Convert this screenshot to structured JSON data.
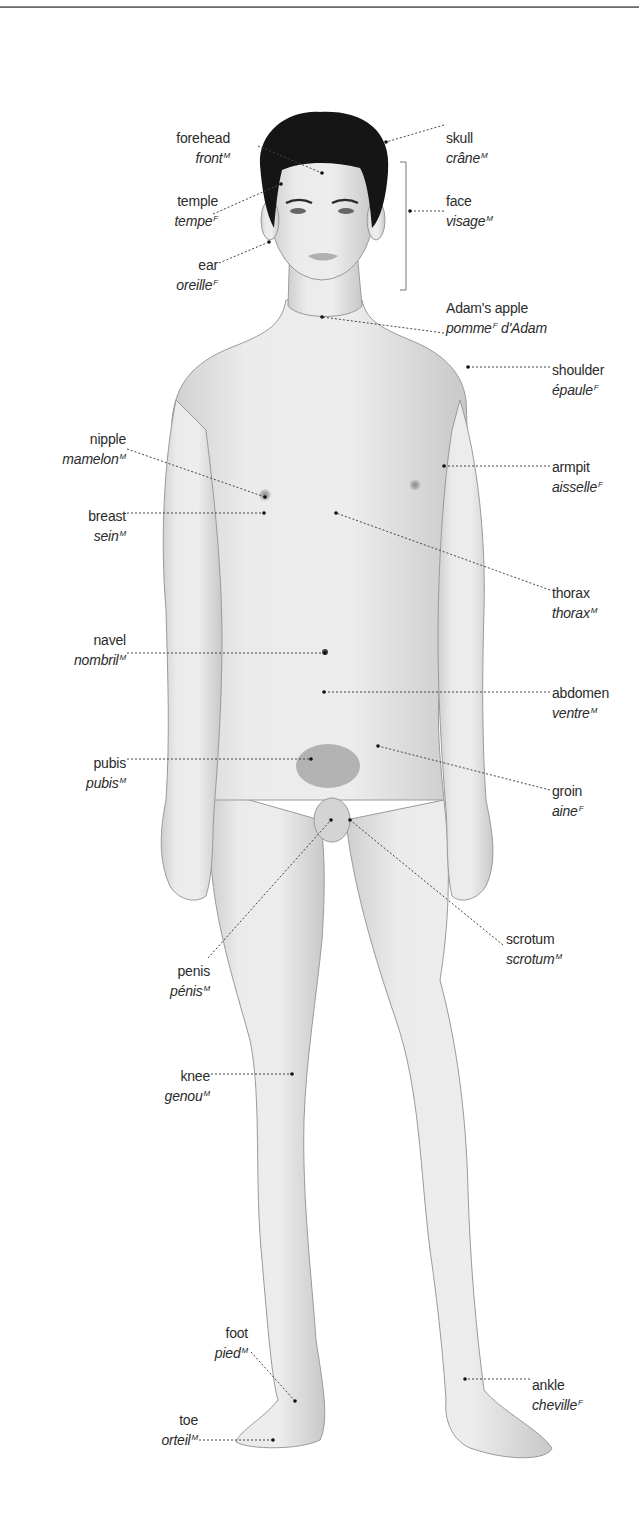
{
  "figure": {
    "colors": {
      "skin": "#e6e6e6",
      "skin_shadow": "#c9c9c9",
      "outline": "#8a8a8a",
      "hair": "#141414",
      "leader": "#444444",
      "text": "#2b2b2b",
      "rule": "#6e6e6e"
    }
  },
  "labels": [
    {
      "id": "forehead",
      "en": "forehead",
      "fr": "front",
      "gender": "M",
      "side": "left",
      "x": 230,
      "y": 130,
      "point": [
        322,
        173
      ],
      "from": [
        258,
        146
      ]
    },
    {
      "id": "skull",
      "en": "skull",
      "fr": "crâne",
      "gender": "M",
      "side": "right",
      "x": 446,
      "y": 130,
      "point": [
        386,
        142
      ],
      "from": [
        444,
        125
      ]
    },
    {
      "id": "temple",
      "en": "temple",
      "fr": "tempe",
      "gender": "F",
      "side": "left",
      "x": 218,
      "y": 193,
      "point": [
        281,
        184
      ],
      "from": [
        213,
        214
      ]
    },
    {
      "id": "face",
      "en": "face",
      "fr": "visage",
      "gender": "M",
      "side": "right",
      "x": 446,
      "y": 193,
      "point": [
        410,
        211
      ],
      "from": [
        444,
        211
      ]
    },
    {
      "id": "ear",
      "en": "ear",
      "fr": "oreille",
      "gender": "F",
      "side": "left",
      "x": 218,
      "y": 257,
      "point": [
        269,
        242
      ],
      "from": [
        219,
        263
      ]
    },
    {
      "id": "adams-apple",
      "en": "Adam's apple",
      "fr": "pomme",
      "gender": "F",
      "fr_suffix": " d'Adam",
      "side": "right",
      "x": 446,
      "y": 300,
      "point": [
        322,
        317
      ],
      "from": [
        444,
        333
      ]
    },
    {
      "id": "shoulder",
      "en": "shoulder",
      "fr": "épaule",
      "gender": "F",
      "side": "right",
      "x": 552,
      "y": 362,
      "point": [
        468,
        367
      ],
      "from": [
        550,
        367
      ]
    },
    {
      "id": "nipple",
      "en": "nipple",
      "fr": "mamelon",
      "gender": "M",
      "side": "left",
      "x": 126,
      "y": 431,
      "point": [
        265,
        497
      ],
      "from": [
        127,
        449
      ]
    },
    {
      "id": "breast",
      "en": "breast",
      "fr": "sein",
      "gender": "M",
      "side": "left",
      "x": 126,
      "y": 508,
      "point": [
        264,
        513
      ],
      "from": [
        127,
        513
      ]
    },
    {
      "id": "armpit",
      "en": "armpit",
      "fr": "aisselle",
      "gender": "F",
      "side": "right",
      "x": 552,
      "y": 459,
      "point": [
        444,
        466
      ],
      "from": [
        550,
        466
      ]
    },
    {
      "id": "thorax",
      "en": "thorax",
      "fr": "thorax",
      "gender": "M",
      "side": "right",
      "x": 552,
      "y": 585,
      "point": [
        336,
        513
      ],
      "from": [
        550,
        590
      ]
    },
    {
      "id": "navel",
      "en": "navel",
      "fr": "nombril",
      "gender": "M",
      "side": "left",
      "x": 126,
      "y": 632,
      "point": [
        325,
        653
      ],
      "from": [
        127,
        653
      ]
    },
    {
      "id": "abdomen",
      "en": "abdomen",
      "fr": "ventre",
      "gender": "M",
      "side": "right",
      "x": 552,
      "y": 685,
      "point": [
        324,
        692
      ],
      "from": [
        550,
        692
      ]
    },
    {
      "id": "pubis",
      "en": "pubis",
      "fr": "pubis",
      "gender": "M",
      "side": "left",
      "x": 126,
      "y": 755,
      "point": [
        311,
        759
      ],
      "from": [
        127,
        759
      ]
    },
    {
      "id": "groin",
      "en": "groin",
      "fr": "aine",
      "gender": "F",
      "side": "right",
      "x": 552,
      "y": 783,
      "point": [
        378,
        746
      ],
      "from": [
        550,
        790
      ]
    },
    {
      "id": "scrotum",
      "en": "scrotum",
      "fr": "scrotum",
      "gender": "M",
      "side": "right",
      "x": 506,
      "y": 931,
      "point": [
        350,
        820
      ],
      "from": [
        503,
        945
      ]
    },
    {
      "id": "penis",
      "en": "penis",
      "fr": "pénis",
      "gender": "M",
      "side": "left",
      "x": 210,
      "y": 963,
      "point": [
        331,
        820
      ],
      "from": [
        208,
        958
      ]
    },
    {
      "id": "knee",
      "en": "knee",
      "fr": "genou",
      "gender": "M",
      "side": "left",
      "x": 210,
      "y": 1068,
      "point": [
        292,
        1074
      ],
      "from": [
        211,
        1074
      ]
    },
    {
      "id": "foot",
      "en": "foot",
      "fr": "pied",
      "gender": "M",
      "side": "left",
      "x": 248,
      "y": 1325,
      "point": [
        295,
        1401
      ],
      "from": [
        251,
        1352
      ]
    },
    {
      "id": "ankle",
      "en": "ankle",
      "fr": "cheville",
      "gender": "F",
      "side": "right",
      "x": 532,
      "y": 1377,
      "point": [
        465,
        1379
      ],
      "from": [
        530,
        1379
      ]
    },
    {
      "id": "toe",
      "en": "toe",
      "fr": "orteil",
      "gender": "M",
      "side": "left",
      "x": 198,
      "y": 1412,
      "point": [
        273,
        1440
      ],
      "from": [
        199,
        1440
      ]
    }
  ],
  "bracket": {
    "for": "face",
    "x": 406,
    "top": 162,
    "bottom": 290
  }
}
